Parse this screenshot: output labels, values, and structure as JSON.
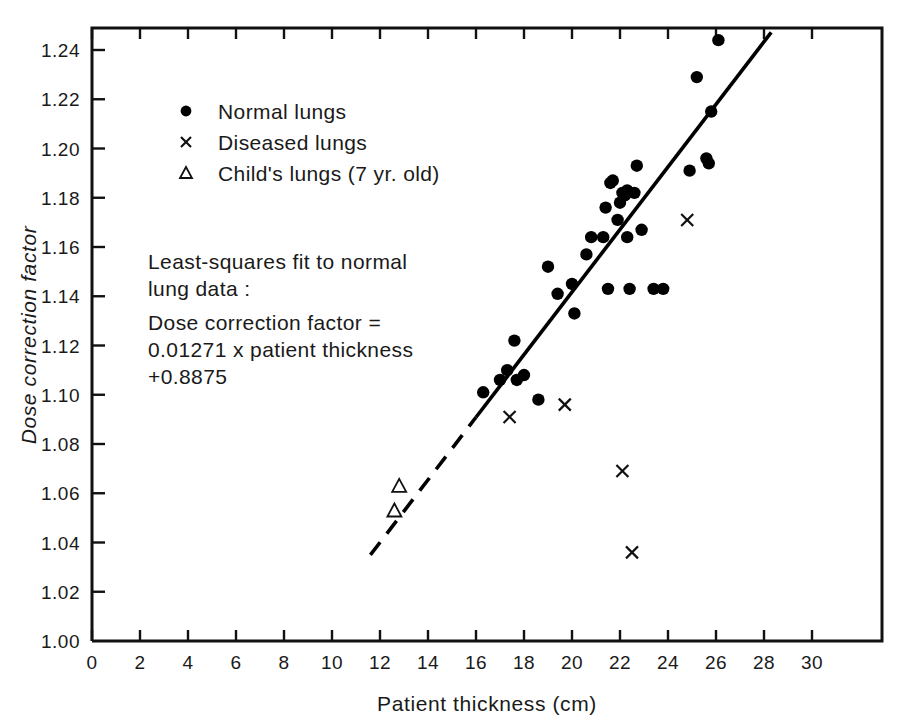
{
  "chart_data": {
    "type": "scatter",
    "title": "",
    "xlabel": "Patient thickness (cm)",
    "ylabel": "Dose correction factor",
    "xlim": [
      0,
      31.5
    ],
    "ylim": [
      1.0,
      1.25
    ],
    "xticks": [
      0,
      2,
      4,
      6,
      8,
      10,
      12,
      14,
      16,
      18,
      20,
      22,
      24,
      26,
      28,
      30
    ],
    "xtick_labels": [
      "0",
      "2",
      "4",
      "6",
      "8",
      "10",
      "12",
      "14",
      "16",
      "18",
      "20",
      "22",
      "24",
      "26",
      "28",
      "30"
    ],
    "yticks": [
      1.0,
      1.02,
      1.04,
      1.06,
      1.08,
      1.1,
      1.12,
      1.14,
      1.16,
      1.18,
      1.2,
      1.22,
      1.24
    ],
    "ytick_labels": [
      "1.00",
      "1.02",
      "1.04",
      "1.06",
      "1.08",
      "1.10",
      "1.12",
      "1.14",
      "1.16",
      "1.18",
      "1.20",
      "1.22",
      "1.24"
    ],
    "grid": false,
    "legend_position": "upper-left-inside",
    "series": [
      {
        "name": "Normal lungs",
        "marker": "filled-circle",
        "points": [
          [
            16.3,
            1.101
          ],
          [
            17.0,
            1.106
          ],
          [
            17.3,
            1.11
          ],
          [
            17.6,
            1.122
          ],
          [
            17.7,
            1.106
          ],
          [
            18.0,
            1.108
          ],
          [
            18.6,
            1.098
          ],
          [
            19.0,
            1.152
          ],
          [
            19.4,
            1.141
          ],
          [
            20.0,
            1.145
          ],
          [
            20.1,
            1.133
          ],
          [
            20.6,
            1.157
          ],
          [
            20.8,
            1.164
          ],
          [
            21.3,
            1.164
          ],
          [
            21.4,
            1.176
          ],
          [
            21.5,
            1.143
          ],
          [
            21.6,
            1.186
          ],
          [
            21.7,
            1.187
          ],
          [
            21.9,
            1.171
          ],
          [
            22.0,
            1.178
          ],
          [
            22.1,
            1.182
          ],
          [
            22.2,
            1.181
          ],
          [
            22.3,
            1.183
          ],
          [
            22.3,
            1.164
          ],
          [
            22.4,
            1.143
          ],
          [
            22.6,
            1.182
          ],
          [
            22.7,
            1.193
          ],
          [
            22.9,
            1.167
          ],
          [
            23.4,
            1.143
          ],
          [
            23.8,
            1.143
          ],
          [
            24.9,
            1.191
          ],
          [
            25.2,
            1.229
          ],
          [
            25.6,
            1.196
          ],
          [
            25.7,
            1.194
          ],
          [
            25.8,
            1.215
          ],
          [
            26.1,
            1.244
          ]
        ]
      },
      {
        "name": "Diseased lungs",
        "marker": "x",
        "points": [
          [
            17.4,
            1.091
          ],
          [
            19.7,
            1.096
          ],
          [
            22.1,
            1.069
          ],
          [
            22.5,
            1.036
          ],
          [
            24.8,
            1.171
          ]
        ]
      },
      {
        "name": "Child's lungs (7 yr. old)",
        "marker": "open-triangle",
        "points": [
          [
            12.8,
            1.063
          ],
          [
            12.6,
            1.053
          ]
        ]
      }
    ],
    "fit_line": {
      "equation_slope": 0.01271,
      "equation_intercept": 0.8875,
      "solid_range_x": [
        16.0,
        28.3
      ],
      "dashed_range_x": [
        11.6,
        16.0
      ],
      "y_at_xmin": 1.0349,
      "y_at_xmax": 1.2472
    },
    "annotation": {
      "lines": [
        "Least-squares fit to normal",
        "lung data :",
        "Dose correction factor =",
        "0.01271 x patient thickness",
        "+0.8875"
      ]
    }
  },
  "legend": {
    "entries": [
      {
        "marker": "filled-circle",
        "label": "Normal lungs"
      },
      {
        "marker": "x",
        "label": "Diseased lungs"
      },
      {
        "marker": "open-triangle",
        "label": "Child's lungs  (7 yr. old)"
      }
    ]
  },
  "colors": {
    "ink": "#111111",
    "background": "#ffffff"
  }
}
